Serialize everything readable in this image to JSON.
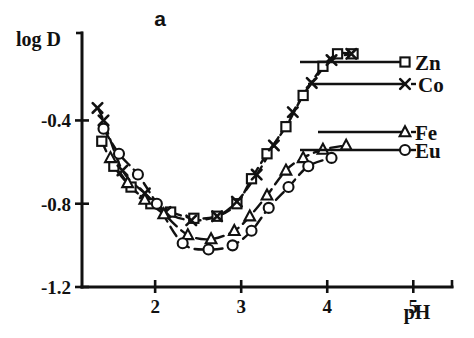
{
  "figure": {
    "panel_label": "a",
    "background": "#ffffff",
    "ink_color": "#111111"
  },
  "chart_data": {
    "type": "line",
    "title": "a",
    "xlabel": "pH",
    "ylabel": "log D",
    "xlim": [
      1.15,
      5.45
    ],
    "ylim": [
      -1.2,
      0.02
    ],
    "grid": false,
    "legend_position": "right",
    "xticks": [
      "2",
      "3",
      "4",
      "5"
    ],
    "xtick_values": [
      2,
      3,
      4,
      5
    ],
    "yticks": [
      "-0.4",
      "-0.8",
      "-1.2"
    ],
    "ytick_values": [
      -0.4,
      -0.8,
      -1.2
    ],
    "series": [
      {
        "name": "Zn",
        "marker": "square",
        "x": [
          1.38,
          1.52,
          1.72,
          1.95,
          2.18,
          2.45,
          2.72,
          2.95,
          3.12,
          3.3,
          3.52,
          3.72,
          3.95,
          4.12,
          4.3
        ],
        "values": [
          -0.5,
          -0.62,
          -0.72,
          -0.8,
          -0.84,
          -0.87,
          -0.86,
          -0.8,
          -0.68,
          -0.56,
          -0.43,
          -0.28,
          -0.14,
          -0.08,
          -0.08
        ]
      },
      {
        "name": "Co",
        "marker": "cross",
        "x": [
          1.33,
          1.4,
          1.62,
          1.88,
          2.12,
          2.42,
          2.72,
          2.95,
          3.18,
          3.38,
          3.6,
          3.82,
          4.05,
          4.28
        ],
        "values": [
          -0.34,
          -0.4,
          -0.64,
          -0.75,
          -0.84,
          -0.88,
          -0.86,
          -0.79,
          -0.66,
          -0.52,
          -0.36,
          -0.22,
          -0.11,
          -0.08
        ]
      },
      {
        "name": "Fe",
        "marker": "triangle",
        "x": [
          1.48,
          1.68,
          1.88,
          2.1,
          2.38,
          2.65,
          2.92,
          3.1,
          3.3,
          3.52,
          3.72,
          3.95,
          4.22
        ],
        "values": [
          -0.58,
          -0.7,
          -0.78,
          -0.85,
          -0.95,
          -0.97,
          -0.93,
          -0.86,
          -0.76,
          -0.64,
          -0.58,
          -0.54,
          -0.52
        ]
      },
      {
        "name": "Eu",
        "marker": "circle",
        "x": [
          1.4,
          1.58,
          1.8,
          2.02,
          2.32,
          2.62,
          2.9,
          3.12,
          3.32,
          3.55,
          3.78,
          4.05
        ],
        "values": [
          -0.44,
          -0.56,
          -0.66,
          -0.8,
          -0.99,
          -1.02,
          -1.0,
          -0.93,
          -0.82,
          -0.72,
          -0.62,
          -0.58
        ]
      }
    ],
    "legend": [
      {
        "name": "Zn",
        "marker": "square"
      },
      {
        "name": "Co",
        "marker": "cross"
      },
      {
        "name": "Fe",
        "marker": "triangle"
      },
      {
        "name": "Eu",
        "marker": "circle"
      }
    ]
  }
}
